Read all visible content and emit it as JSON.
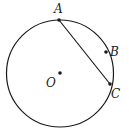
{
  "diagram": {
    "type": "geometry-circle",
    "circle": {
      "cx": 60,
      "cy": 73.5,
      "r": 53.5,
      "stroke": "#1a1a1a"
    },
    "points": [
      {
        "id": "A",
        "label": "A",
        "x": 59,
        "y": 20,
        "label_x": 54,
        "label_y": 13
      },
      {
        "id": "B",
        "label": "B",
        "x": 106,
        "y": 52,
        "label_x": 110,
        "label_y": 56
      },
      {
        "id": "C",
        "label": "C",
        "x": 110,
        "y": 84,
        "label_x": 111,
        "label_y": 98
      },
      {
        "id": "O",
        "label": "O",
        "x": 60,
        "y": 73,
        "label_x": 46,
        "label_y": 87
      }
    ],
    "segments": [
      {
        "from": "A",
        "to": "C"
      }
    ]
  }
}
